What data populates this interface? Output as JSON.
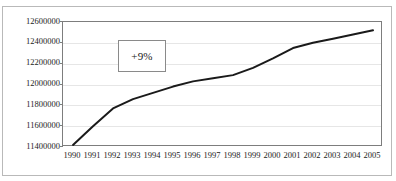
{
  "figure": {
    "top_remnant_text": "",
    "background_color": "#ffffff",
    "frame_color": "#b9b9b9",
    "plot_border_color": "#7d7d7d",
    "grid_color": "#e6e6e6",
    "line_color": "#1a1a1a"
  },
  "annotation": {
    "label": "+9%",
    "border_color": "#8a8a8a"
  },
  "chart_data": {
    "type": "line",
    "title": "",
    "subtitle": "",
    "xlabel": "",
    "ylabel": "",
    "grid": true,
    "legend": false,
    "legend_position": "none",
    "categories": [
      "1990",
      "1991",
      "1992",
      "1993",
      "1994",
      "1995",
      "1996",
      "1997",
      "1998",
      "1999",
      "2000",
      "2001",
      "2002",
      "2003",
      "2004",
      "2005"
    ],
    "x": [
      1990,
      1991,
      1992,
      1993,
      1994,
      1995,
      1996,
      1997,
      1998,
      1999,
      2000,
      2001,
      2002,
      2003,
      2004,
      2005
    ],
    "values": [
      11420000,
      11600000,
      11770000,
      11860000,
      11920000,
      11980000,
      12030000,
      12060000,
      12090000,
      12160000,
      12250000,
      12350000,
      12400000,
      12440000,
      12480000,
      12520000
    ],
    "ylim": [
      11400000,
      12600000
    ],
    "yticks": [
      12600000,
      12400000,
      12200000,
      12000000,
      11800000,
      11600000,
      11400000
    ],
    "ytick_labels": [
      "12600000",
      "12400000",
      "12200000",
      "12000000",
      "11800000",
      "11600000",
      "11400000"
    ],
    "annotations": [
      {
        "text": "+9%",
        "x": 1993,
        "y": 12330000
      }
    ]
  }
}
